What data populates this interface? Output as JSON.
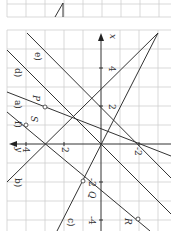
{
  "figure": {
    "axes": {
      "x_label": "x",
      "y_label": "y",
      "x_ticks": [
        "4",
        "2",
        "-2",
        "-4"
      ],
      "y_ticks": [
        "4",
        "2",
        "-2"
      ]
    },
    "lines": [
      {
        "label": "a)",
        "equation": "y = 2.5x - 2"
      },
      {
        "label": "b)",
        "equation": "y = -x + 3"
      },
      {
        "label": "c)",
        "equation": "y = -x/2"
      },
      {
        "label": "d)",
        "equation": "y = x"
      },
      {
        "label": "e)",
        "equation": "y = x - 2"
      },
      {
        "label": "f)",
        "equation": "line through S and R"
      }
    ],
    "points": [
      {
        "label": "P",
        "x": 2,
        "y": 3
      },
      {
        "label": "S",
        "x": 1,
        "y": 4
      },
      {
        "label": "Q",
        "x": -2,
        "y": 1
      },
      {
        "label": "R",
        "x": -4,
        "y": -2
      }
    ],
    "colors": {
      "grid": "#cfcfcf",
      "line": "#333333",
      "background": "#ffffff"
    }
  }
}
